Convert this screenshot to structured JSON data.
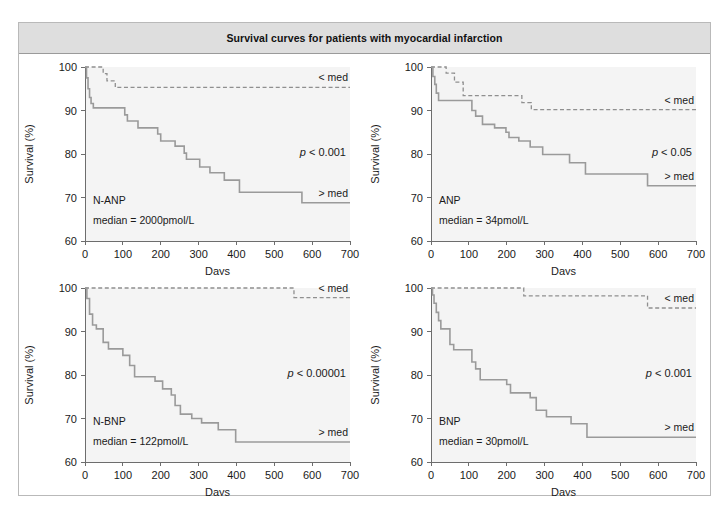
{
  "figure": {
    "title": "Survival curves for patients with myocardial infarction",
    "border_color": "#b9b9b9",
    "title_bar_color": "#dedede"
  },
  "axis": {
    "xlabel": "Days",
    "ylabel": "Survival (%)",
    "xticks": [
      "0",
      "100",
      "200",
      "300",
      "400",
      "500",
      "600",
      "700"
    ],
    "yticks": [
      "60",
      "70",
      "80",
      "90",
      "100"
    ]
  },
  "chart_data": [
    {
      "type": "line",
      "panel": "top-left",
      "title": "N-ANP",
      "subtitle": "median  =  2000pmol/L",
      "pvalue": "p < 0.001",
      "below_median_label": "< med",
      "above_median_label": "> med",
      "xlabel": "Days",
      "ylabel": "Survival (%)",
      "xlim": [
        0,
        700
      ],
      "ylim": [
        60,
        100
      ],
      "xticks": [
        0,
        100,
        200,
        300,
        400,
        500,
        600,
        700
      ],
      "yticks": [
        60,
        70,
        80,
        90,
        100
      ],
      "grid": false,
      "legend_position": "inline-right",
      "series": [
        {
          "name": "< med",
          "style": "dashed",
          "color": "#8f8f8f",
          "points": [
            [
              0,
              100
            ],
            [
              48,
              100
            ],
            [
              48,
              98.5
            ],
            [
              58,
              98.5
            ],
            [
              58,
              96.8
            ],
            [
              80,
              96.8
            ],
            [
              80,
              95.3
            ],
            [
              700,
              95.3
            ]
          ]
        },
        {
          "name": "> med",
          "style": "solid",
          "color": "#9a9a9a",
          "points": [
            [
              0,
              100
            ],
            [
              4,
              100
            ],
            [
              4,
              97.5
            ],
            [
              8,
              97.5
            ],
            [
              8,
              95.0
            ],
            [
              12,
              95.0
            ],
            [
              12,
              93.0
            ],
            [
              16,
              93.0
            ],
            [
              16,
              91.6
            ],
            [
              22,
              91.6
            ],
            [
              22,
              90.6
            ],
            [
              105,
              90.6
            ],
            [
              105,
              89.0
            ],
            [
              112,
              89.0
            ],
            [
              112,
              87.6
            ],
            [
              140,
              87.6
            ],
            [
              140,
              86.0
            ],
            [
              192,
              86.0
            ],
            [
              192,
              84.6
            ],
            [
              200,
              84.6
            ],
            [
              200,
              83.0
            ],
            [
              238,
              83.0
            ],
            [
              238,
              81.8
            ],
            [
              262,
              81.8
            ],
            [
              262,
              80.2
            ],
            [
              268,
              80.2
            ],
            [
              268,
              78.8
            ],
            [
              303,
              78.8
            ],
            [
              303,
              77.0
            ],
            [
              330,
              77.0
            ],
            [
              330,
              75.7
            ],
            [
              368,
              75.7
            ],
            [
              368,
              74.0
            ],
            [
              408,
              74.0
            ],
            [
              408,
              71.2
            ],
            [
              573,
              71.2
            ],
            [
              573,
              68.8
            ],
            [
              700,
              68.8
            ]
          ]
        }
      ]
    },
    {
      "type": "line",
      "panel": "top-right",
      "title": "ANP",
      "subtitle": "median  =  34pmol/L",
      "pvalue": "p < 0.05",
      "below_median_label": "< med",
      "above_median_label": "> med",
      "xlabel": "Days",
      "ylabel": "Survival (%)",
      "xlim": [
        0,
        700
      ],
      "ylim": [
        60,
        100
      ],
      "xticks": [
        0,
        100,
        200,
        300,
        400,
        500,
        600,
        700
      ],
      "yticks": [
        60,
        70,
        80,
        90,
        100
      ],
      "grid": false,
      "legend_position": "inline-right",
      "series": [
        {
          "name": "< med",
          "style": "dashed",
          "color": "#8f8f8f",
          "points": [
            [
              0,
              100
            ],
            [
              40,
              100
            ],
            [
              40,
              98.6
            ],
            [
              62,
              98.6
            ],
            [
              62,
              96.5
            ],
            [
              85,
              96.5
            ],
            [
              85,
              93.4
            ],
            [
              240,
              93.4
            ],
            [
              240,
              91.8
            ],
            [
              265,
              91.8
            ],
            [
              265,
              90.2
            ],
            [
              700,
              90.2
            ]
          ]
        },
        {
          "name": "> med",
          "style": "solid",
          "color": "#9a9a9a",
          "points": [
            [
              0,
              100
            ],
            [
              5,
              100
            ],
            [
              5,
              97.8
            ],
            [
              10,
              97.8
            ],
            [
              10,
              96.0
            ],
            [
              14,
              96.0
            ],
            [
              14,
              94.0
            ],
            [
              20,
              94.0
            ],
            [
              20,
              92.3
            ],
            [
              108,
              92.3
            ],
            [
              108,
              90.0
            ],
            [
              118,
              90.0
            ],
            [
              118,
              88.7
            ],
            [
              136,
              88.7
            ],
            [
              136,
              86.8
            ],
            [
              168,
              86.8
            ],
            [
              168,
              86.0
            ],
            [
              198,
              86.0
            ],
            [
              198,
              85.0
            ],
            [
              206,
              85.0
            ],
            [
              206,
              83.8
            ],
            [
              232,
              83.8
            ],
            [
              232,
              83.0
            ],
            [
              262,
              83.0
            ],
            [
              262,
              81.6
            ],
            [
              295,
              81.6
            ],
            [
              295,
              79.9
            ],
            [
              366,
              79.9
            ],
            [
              366,
              78.0
            ],
            [
              408,
              78.0
            ],
            [
              408,
              75.4
            ],
            [
              572,
              75.4
            ],
            [
              572,
              72.7
            ],
            [
              700,
              72.7
            ]
          ]
        }
      ]
    },
    {
      "type": "line",
      "panel": "bottom-left",
      "title": "N-BNP",
      "subtitle": "median  =  122pmol/L",
      "pvalue": "p < 0.00001",
      "below_median_label": "< med",
      "above_median_label": "> med",
      "xlabel": "Days",
      "ylabel": "Survival (%)",
      "xlim": [
        0,
        700
      ],
      "ylim": [
        60,
        100
      ],
      "xticks": [
        0,
        100,
        200,
        300,
        400,
        500,
        600,
        700
      ],
      "yticks": [
        60,
        70,
        80,
        90,
        100
      ],
      "grid": false,
      "legend_position": "inline-right",
      "series": [
        {
          "name": "< med",
          "style": "dashed",
          "color": "#8f8f8f",
          "points": [
            [
              0,
              100
            ],
            [
              552,
              100
            ],
            [
              552,
              97.8
            ],
            [
              700,
              97.8
            ]
          ]
        },
        {
          "name": "> med",
          "style": "solid",
          "color": "#9a9a9a",
          "points": [
            [
              0,
              100
            ],
            [
              5,
              100
            ],
            [
              5,
              97.6
            ],
            [
              12,
              97.6
            ],
            [
              12,
              94.0
            ],
            [
              20,
              94.0
            ],
            [
              20,
              91.5
            ],
            [
              30,
              91.5
            ],
            [
              30,
              90.6
            ],
            [
              48,
              90.6
            ],
            [
              48,
              87.5
            ],
            [
              62,
              87.5
            ],
            [
              62,
              86.0
            ],
            [
              100,
              86.0
            ],
            [
              100,
              84.5
            ],
            [
              118,
              84.5
            ],
            [
              118,
              82.2
            ],
            [
              131,
              82.2
            ],
            [
              131,
              79.6
            ],
            [
              185,
              79.6
            ],
            [
              185,
              78.6
            ],
            [
              205,
              78.6
            ],
            [
              205,
              76.8
            ],
            [
              228,
              76.8
            ],
            [
              228,
              75.4
            ],
            [
              238,
              75.4
            ],
            [
              238,
              73.0
            ],
            [
              252,
              73.0
            ],
            [
              252,
              71.0
            ],
            [
              282,
              71.0
            ],
            [
              282,
              70.0
            ],
            [
              308,
              70.0
            ],
            [
              308,
              69.0
            ],
            [
              352,
              69.0
            ],
            [
              352,
              67.4
            ],
            [
              398,
              67.4
            ],
            [
              398,
              64.6
            ],
            [
              700,
              64.6
            ]
          ]
        }
      ]
    },
    {
      "type": "line",
      "panel": "bottom-right",
      "title": "BNP",
      "subtitle": "median  =  30pmol/L",
      "pvalue": "p < 0.001",
      "below_median_label": "< med",
      "above_median_label": "> med",
      "xlabel": "Days",
      "ylabel": "Survival (%)",
      "xlim": [
        0,
        700
      ],
      "ylim": [
        60,
        100
      ],
      "xticks": [
        0,
        100,
        200,
        300,
        400,
        500,
        600,
        700
      ],
      "yticks": [
        60,
        70,
        80,
        90,
        100
      ],
      "grid": false,
      "legend_position": "inline-right",
      "series": [
        {
          "name": "< med",
          "style": "dashed",
          "color": "#8f8f8f",
          "points": [
            [
              0,
              100
            ],
            [
              245,
              100
            ],
            [
              245,
              98.2
            ],
            [
              572,
              98.2
            ],
            [
              572,
              95.4
            ],
            [
              700,
              95.4
            ]
          ]
        },
        {
          "name": "> med",
          "style": "solid",
          "color": "#9a9a9a",
          "points": [
            [
              0,
              100
            ],
            [
              4,
              100
            ],
            [
              4,
              98.4
            ],
            [
              8,
              98.4
            ],
            [
              8,
              96.5
            ],
            [
              14,
              96.5
            ],
            [
              14,
              94.4
            ],
            [
              20,
              94.4
            ],
            [
              20,
              92.5
            ],
            [
              26,
              92.5
            ],
            [
              26,
              90.6
            ],
            [
              50,
              90.6
            ],
            [
              50,
              87.0
            ],
            [
              60,
              87.0
            ],
            [
              60,
              85.8
            ],
            [
              108,
              85.8
            ],
            [
              108,
              83.0
            ],
            [
              118,
              83.0
            ],
            [
              118,
              81.4
            ],
            [
              130,
              81.4
            ],
            [
              130,
              78.9
            ],
            [
              200,
              78.9
            ],
            [
              200,
              77.8
            ],
            [
              210,
              77.8
            ],
            [
              210,
              75.9
            ],
            [
              262,
              75.9
            ],
            [
              262,
              74.8
            ],
            [
              278,
              74.8
            ],
            [
              278,
              71.9
            ],
            [
              305,
              71.9
            ],
            [
              305,
              70.4
            ],
            [
              370,
              70.4
            ],
            [
              370,
              68.8
            ],
            [
              412,
              68.8
            ],
            [
              412,
              65.7
            ],
            [
              700,
              65.7
            ]
          ]
        }
      ]
    }
  ]
}
